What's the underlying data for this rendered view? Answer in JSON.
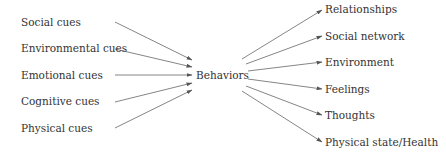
{
  "diagram": {
    "type": "flow",
    "center": {
      "label": "Behaviors"
    },
    "inputs": [
      {
        "label": "Social cues"
      },
      {
        "label": "Environmental cues"
      },
      {
        "label": "Emotional cues"
      },
      {
        "label": "Cognitive cues"
      },
      {
        "label": "Physical cues"
      }
    ],
    "outputs": [
      {
        "label": "Relationships"
      },
      {
        "label": "Social network"
      },
      {
        "label": "Environment"
      },
      {
        "label": "Feelings"
      },
      {
        "label": "Thoughts"
      },
      {
        "label": "Physical state/Health"
      }
    ],
    "colors": {
      "text": "#333333",
      "arrow": "#555555"
    }
  }
}
